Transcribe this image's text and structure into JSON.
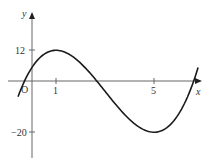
{
  "chart_data": {
    "type": "line",
    "title": "",
    "xlabel": "x",
    "ylabel": "y",
    "origin_label": "O",
    "x_ticks": [
      1,
      5
    ],
    "x_tick_labels": [
      "1",
      "5"
    ],
    "y_ticks": [
      12,
      -20
    ],
    "y_tick_labels": [
      "12",
      "−20"
    ],
    "xlim": [
      -0.95,
      6.9
    ],
    "ylim": [
      -30,
      26
    ],
    "grid": false,
    "legend": null,
    "series": [
      {
        "name": "y = x^3 - 9x^2 + 15x + 5",
        "x": [
          -0.55,
          0,
          1,
          2,
          2.35,
          3,
          4,
          5,
          6,
          6.8
        ],
        "y": [
          -4.2,
          5,
          12,
          3,
          -0.1,
          -4,
          -15,
          -20,
          -13,
          5.2
        ]
      }
    ],
    "annotations": {
      "maximum": {
        "x": 1,
        "y": 12
      },
      "minimum": {
        "x": 5,
        "y": -20
      }
    }
  },
  "colors": {
    "curve": "#1a1a1a",
    "axis": "#555555",
    "text": "#333333"
  }
}
